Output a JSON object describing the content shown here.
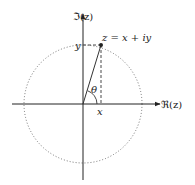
{
  "diagram": {
    "axes": {
      "real_label": "ℜ(z)",
      "imag_label": "ℑ(z)"
    },
    "point_label": "z = x + iy",
    "x_label": "x",
    "y_label": "y",
    "angle_label": "θ",
    "colors": {
      "axis": "#222222",
      "circle": "#555555",
      "line": "#333333"
    }
  }
}
